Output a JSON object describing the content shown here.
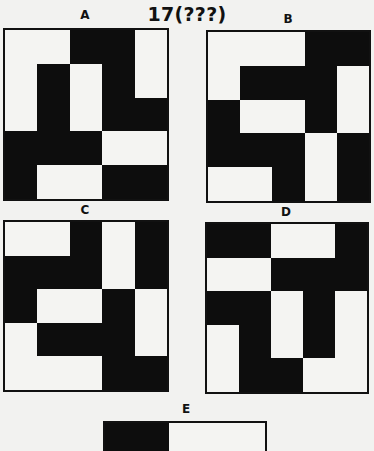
{
  "title": "17(???)",
  "panels": [
    {
      "label": "A",
      "grid": [
        [
          0,
          0,
          1,
          1,
          0
        ],
        [
          0,
          1,
          0,
          1,
          0
        ],
        [
          0,
          1,
          0,
          1,
          1
        ],
        [
          1,
          1,
          1,
          0,
          0
        ],
        [
          1,
          0,
          0,
          1,
          1
        ]
      ]
    },
    {
      "label": "B",
      "grid": [
        [
          0,
          0,
          0,
          1,
          1
        ],
        [
          0,
          1,
          1,
          1,
          0
        ],
        [
          1,
          0,
          0,
          1,
          0
        ],
        [
          1,
          1,
          1,
          0,
          1
        ],
        [
          0,
          0,
          1,
          0,
          1
        ]
      ]
    },
    {
      "label": "C",
      "grid": [
        [
          0,
          0,
          1,
          0,
          1
        ],
        [
          1,
          1,
          1,
          0,
          1
        ],
        [
          1,
          0,
          0,
          1,
          0
        ],
        [
          0,
          1,
          1,
          1,
          0
        ],
        [
          0,
          0,
          0,
          1,
          1
        ]
      ]
    },
    {
      "label": "D",
      "grid": [
        [
          1,
          1,
          0,
          0,
          1
        ],
        [
          0,
          0,
          1,
          1,
          1
        ],
        [
          1,
          1,
          0,
          1,
          0
        ],
        [
          0,
          1,
          0,
          1,
          0
        ],
        [
          0,
          1,
          1,
          0,
          0
        ]
      ]
    },
    {
      "label": "E",
      "grid_visible_top_row": [
        1,
        1,
        0,
        0,
        0
      ]
    }
  ],
  "colors": {
    "black": "#0d0d0d",
    "white": "#f4f4f2",
    "background": "#f2f2f0"
  }
}
